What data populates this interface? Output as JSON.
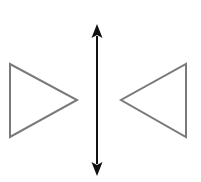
{
  "diagram": {
    "type": "reflection-symmetry",
    "colors": {
      "background": "#ffffff",
      "triangle_stroke": "#7a7a7a",
      "axis": "#111111"
    },
    "left_triangle": {
      "points": "10,64 10,137 77,100",
      "direction": "right"
    },
    "right_triangle": {
      "points": "186,64 186,137 121,100",
      "direction": "left"
    },
    "axis": {
      "x": 97,
      "y1": 30,
      "y2": 170,
      "orientation": "vertical",
      "double_headed": true
    }
  }
}
